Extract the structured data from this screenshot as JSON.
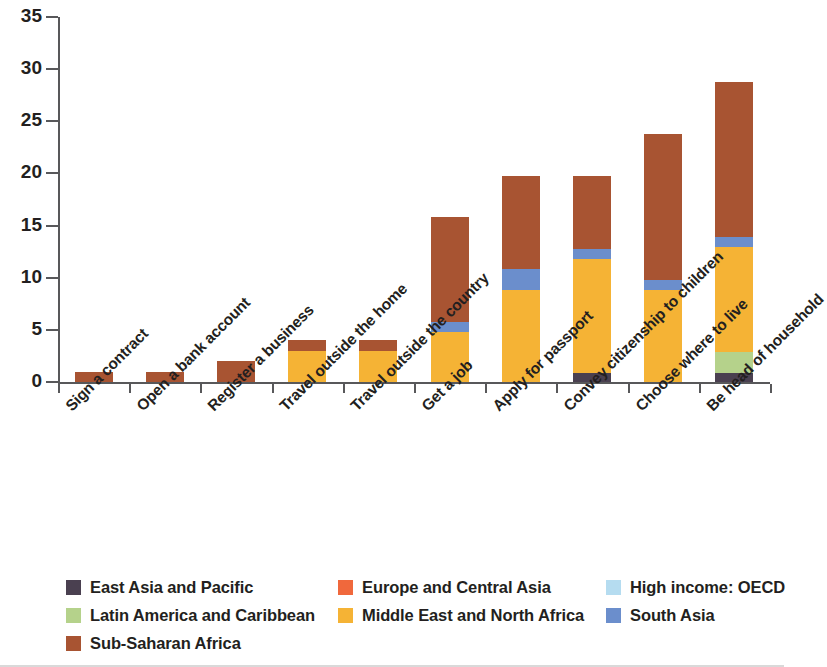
{
  "chart_data": {
    "type": "bar",
    "stacked": true,
    "title": "",
    "subtitle": "",
    "xlabel": "",
    "ylabel": "",
    "ylim": [
      0,
      35
    ],
    "ytick_labels": [
      "0",
      "5",
      "10",
      "15",
      "20",
      "25",
      "30",
      "35"
    ],
    "ytick_values": [
      0,
      5,
      10,
      15,
      20,
      25,
      30,
      35
    ],
    "grid": false,
    "legend_position": "bottom",
    "categories": [
      "Sign a contract",
      "Open a bank account",
      "Register a business",
      "Travel outside the home",
      "Travel outside the country",
      "Get a job",
      "Apply for passport",
      "Convey citizenship to children",
      "Choose where to live",
      "Be head of household"
    ],
    "series": [
      {
        "name": "East Asia and Pacific",
        "color": "#4a4050",
        "values": [
          0,
          0,
          0,
          0,
          0,
          0,
          0,
          0.9,
          0,
          0.9
        ]
      },
      {
        "name": "Latin America and Caribbean",
        "color": "#b5d28b",
        "values": [
          0,
          0,
          0,
          0,
          0,
          0,
          0,
          0,
          0,
          2.0
        ]
      },
      {
        "name": "Europe and Central Asia",
        "color": "#f0683c",
        "values": [
          0,
          0,
          0,
          0,
          0,
          0,
          0,
          0,
          0,
          0
        ]
      },
      {
        "name": "Middle East and North Africa",
        "color": "#f5b335",
        "values": [
          0,
          0,
          0,
          3.0,
          3.0,
          4.8,
          8.8,
          10.9,
          8.8,
          10.0
        ]
      },
      {
        "name": "High income: OECD",
        "color": "#b5dcf0",
        "values": [
          0,
          0,
          0,
          0,
          0,
          0,
          0,
          0,
          0,
          0
        ]
      },
      {
        "name": "South Asia",
        "color": "#6b8ecc",
        "values": [
          0,
          0,
          0,
          0,
          0,
          1.0,
          2.0,
          1.0,
          1.0,
          1.0
        ]
      },
      {
        "name": "Sub-Saharan Africa",
        "color": "#a85432",
        "values": [
          1.0,
          1.0,
          2.0,
          1.0,
          1.0,
          10.0,
          9.0,
          7.0,
          14.0,
          14.9
        ]
      }
    ],
    "totals": [
      1.0,
      1.0,
      2.0,
      4.0,
      4.0,
      15.8,
      19.8,
      19.8,
      23.8,
      28.8
    ]
  },
  "legend": {
    "items": [
      {
        "label": "East Asia and Pacific",
        "color": "#4a4050",
        "col": 0,
        "row": 0
      },
      {
        "label": "Latin America and Caribbean",
        "color": "#b5d28b",
        "col": 0,
        "row": 1
      },
      {
        "label": "Sub-Saharan Africa",
        "color": "#a85432",
        "col": 0,
        "row": 2
      },
      {
        "label": "Europe and Central Asia",
        "color": "#f0683c",
        "col": 1,
        "row": 0
      },
      {
        "label": "Middle East and North Africa",
        "color": "#f5b335",
        "col": 1,
        "row": 1
      },
      {
        "label": "High income: OECD",
        "color": "#b5dcf0",
        "col": 2,
        "row": 0
      },
      {
        "label": "South Asia",
        "color": "#6b8ecc",
        "col": 2,
        "row": 1
      }
    ]
  }
}
